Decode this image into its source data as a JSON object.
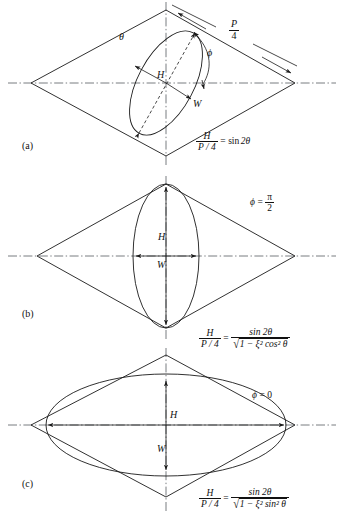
{
  "figure": {
    "type": "technical-line-diagram",
    "panels": [
      {
        "id": "a",
        "label": "(a)",
        "angle_label": "θ",
        "phi_label": "ϕ",
        "dimension_labels": {
          "height": "H",
          "width": "W"
        },
        "side_label": {
          "numerator": "P",
          "denominator": "4"
        },
        "equation": {
          "lhs": {
            "numerator": "H",
            "denominator": "P / 4"
          },
          "relation": "=",
          "rhs_plain": "sin 2θ",
          "rhs_type": "simple"
        },
        "ellipse": {
          "orientation": "tilted",
          "tilt_deg": 60
        }
      },
      {
        "id": "b",
        "label": "(b)",
        "phi_condition": {
          "symbol": "ϕ",
          "relation": "=",
          "value_num": "π",
          "value_den": "2"
        },
        "dimension_labels": {
          "height": "H",
          "width": "W"
        },
        "equation": {
          "lhs": {
            "numerator": "H",
            "denominator": "P / 4"
          },
          "relation": "=",
          "rhs_type": "fraction-sqrt",
          "rhs_numerator": "sin 2θ",
          "rhs_denominator_radicand": "1 − ξ² cos² θ"
        },
        "ellipse": {
          "orientation": "vertical-major"
        }
      },
      {
        "id": "c",
        "label": "(c)",
        "phi_condition": {
          "symbol": "ϕ",
          "relation": "=",
          "value": "0"
        },
        "dimension_labels": {
          "height": "H",
          "width": "W"
        },
        "equation": {
          "lhs": {
            "numerator": "H",
            "denominator": "P / 4"
          },
          "relation": "=",
          "rhs_type": "fraction-sqrt",
          "rhs_numerator": "sin 2θ",
          "rhs_denominator_radicand": "1 − ξ² sin² θ"
        },
        "ellipse": {
          "orientation": "horizontal-major"
        }
      }
    ],
    "symbols": {
      "theta": "θ",
      "phi": "ϕ",
      "xi": "ξ",
      "pi": "π",
      "sin": "sin",
      "cos": "cos",
      "radical": "√",
      "minus": "−",
      "sup_two": "2",
      "equals": "=",
      "two_theta": "2θ",
      "zero": "0",
      "P": "P",
      "four": "4",
      "H": "H",
      "W": "W",
      "P_over_4_inline": "P / 4"
    },
    "colors": {
      "ink": "#1a1a1a",
      "centerline": "#555a5f",
      "background": "#ffffff"
    }
  }
}
